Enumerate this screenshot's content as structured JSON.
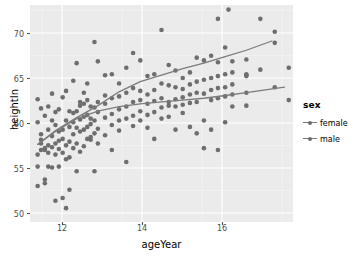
{
  "chart_data": {
    "type": "scatter",
    "title": "",
    "xlabel": "ageYear",
    "ylabel": "heightIn",
    "xlim": [
      11.4,
      17.6
    ],
    "ylim": [
      49.0,
      72.5
    ],
    "xticks": [
      12,
      14,
      16
    ],
    "yticks": [
      50,
      55,
      60,
      65,
      70
    ],
    "grid": true,
    "legend": {
      "title": "sex",
      "position": "right",
      "entries": [
        "female",
        "male"
      ]
    },
    "colors": {
      "point": "#6e6e6e",
      "line": "#7b7b7b",
      "panel_background": "#ebebeb",
      "grid_major": "#ffffff",
      "grid_minor": "#f5f5f5",
      "axis_text": "#4d4d4d",
      "axis_title": "#000000"
    },
    "series": [
      {
        "name": "female",
        "points": [
          [
            11.58,
            56.3
          ],
          [
            11.58,
            62.3
          ],
          [
            11.58,
            59.8
          ],
          [
            11.58,
            55.0
          ],
          [
            11.58,
            52.9
          ],
          [
            11.66,
            61.3
          ],
          [
            11.66,
            57.5
          ],
          [
            11.66,
            57.9
          ],
          [
            11.66,
            56.8
          ],
          [
            11.66,
            58.5
          ],
          [
            11.75,
            60.5
          ],
          [
            11.75,
            56.8
          ],
          [
            11.75,
            57.0
          ],
          [
            11.75,
            53.6
          ],
          [
            11.75,
            53.2
          ],
          [
            11.83,
            61.5
          ],
          [
            11.83,
            57.3
          ],
          [
            11.83,
            56.5
          ],
          [
            11.83,
            59.0
          ],
          [
            11.83,
            55.0
          ],
          [
            11.92,
            60.0
          ],
          [
            11.92,
            58.3
          ],
          [
            11.92,
            57.1
          ],
          [
            11.92,
            54.9
          ],
          [
            11.92,
            62.9
          ],
          [
            12.0,
            59.5
          ],
          [
            12.0,
            57.5
          ],
          [
            12.0,
            56.3
          ],
          [
            12.0,
            60.9
          ],
          [
            12.0,
            51.3
          ],
          [
            12.08,
            58.8
          ],
          [
            12.08,
            56.9
          ],
          [
            12.08,
            61.2
          ],
          [
            12.08,
            55.0
          ],
          [
            12.08,
            57.8
          ],
          [
            12.17,
            62.5
          ],
          [
            12.17,
            59.0
          ],
          [
            12.17,
            58.0
          ],
          [
            12.17,
            56.5
          ],
          [
            12.17,
            51.6
          ],
          [
            12.25,
            63.2
          ],
          [
            12.25,
            60.0
          ],
          [
            12.25,
            57.3
          ],
          [
            12.25,
            55.8
          ],
          [
            12.25,
            50.5
          ],
          [
            12.33,
            61.0
          ],
          [
            12.33,
            59.3
          ],
          [
            12.33,
            57.7
          ],
          [
            12.33,
            56.0
          ],
          [
            12.33,
            52.5
          ],
          [
            12.42,
            64.3
          ],
          [
            12.42,
            60.8
          ],
          [
            12.42,
            58.5
          ],
          [
            12.42,
            57.0
          ],
          [
            12.42,
            59.8
          ],
          [
            12.5,
            66.2
          ],
          [
            12.5,
            61.0
          ],
          [
            12.5,
            59.2
          ],
          [
            12.5,
            57.5
          ],
          [
            12.5,
            54.5
          ],
          [
            12.58,
            62.0
          ],
          [
            12.58,
            60.1
          ],
          [
            12.58,
            58.8
          ],
          [
            12.58,
            56.6
          ],
          [
            12.58,
            61.6
          ],
          [
            12.67,
            63.0
          ],
          [
            12.67,
            60.4
          ],
          [
            12.67,
            59.0
          ],
          [
            12.67,
            57.2
          ],
          [
            12.67,
            61.8
          ],
          [
            12.75,
            62.2
          ],
          [
            12.75,
            60.6
          ],
          [
            12.75,
            59.3
          ],
          [
            12.75,
            58.0
          ],
          [
            12.75,
            64.0
          ],
          [
            12.83,
            61.5
          ],
          [
            12.83,
            60.2
          ],
          [
            12.83,
            59.6
          ],
          [
            12.83,
            57.9
          ],
          [
            12.83,
            58.2
          ],
          [
            12.92,
            68.5
          ],
          [
            12.92,
            61.4
          ],
          [
            12.92,
            60.0
          ],
          [
            12.92,
            58.6
          ],
          [
            12.92,
            54.5
          ],
          [
            13.0,
            66.4
          ],
          [
            13.0,
            62.0
          ],
          [
            13.0,
            60.9
          ],
          [
            13.0,
            59.1
          ],
          [
            13.0,
            57.5
          ],
          [
            13.17,
            64.9
          ],
          [
            13.17,
            61.8
          ],
          [
            13.17,
            60.3
          ],
          [
            13.17,
            58.4
          ],
          [
            13.17,
            62.7
          ],
          [
            13.33,
            65.0
          ],
          [
            13.33,
            62.4
          ],
          [
            13.33,
            60.7
          ],
          [
            13.33,
            59.5
          ],
          [
            13.33,
            56.8
          ],
          [
            13.5,
            64.0
          ],
          [
            13.5,
            62.6
          ],
          [
            13.5,
            61.2
          ],
          [
            13.5,
            60.0
          ],
          [
            13.5,
            58.9
          ],
          [
            13.67,
            65.7
          ],
          [
            13.67,
            63.0
          ],
          [
            13.67,
            61.5
          ],
          [
            13.67,
            60.2
          ],
          [
            13.67,
            55.5
          ],
          [
            13.83,
            67.3
          ],
          [
            13.83,
            63.5
          ],
          [
            13.83,
            62.0
          ],
          [
            13.83,
            60.5
          ],
          [
            13.83,
            59.4
          ],
          [
            14.0,
            66.5
          ],
          [
            14.0,
            63.2
          ],
          [
            14.0,
            62.2
          ],
          [
            14.0,
            61.0
          ],
          [
            14.0,
            60.0
          ],
          [
            14.17,
            64.8
          ],
          [
            14.17,
            62.8
          ],
          [
            14.17,
            61.8
          ],
          [
            14.17,
            60.6
          ],
          [
            14.17,
            59.2
          ],
          [
            14.33,
            65.0
          ],
          [
            14.33,
            63.3
          ],
          [
            14.33,
            62.1
          ],
          [
            14.33,
            60.9
          ],
          [
            14.33,
            58.0
          ],
          [
            14.5,
            69.8
          ],
          [
            14.5,
            64.0
          ],
          [
            14.5,
            62.4
          ],
          [
            14.5,
            61.4
          ],
          [
            14.5,
            60.2
          ],
          [
            14.67,
            66.0
          ],
          [
            14.67,
            63.8
          ],
          [
            14.67,
            62.0
          ],
          [
            14.67,
            61.6
          ],
          [
            14.67,
            60.4
          ],
          [
            14.83,
            65.4
          ],
          [
            14.83,
            63.6
          ],
          [
            14.83,
            62.3
          ],
          [
            14.83,
            61.5
          ],
          [
            14.83,
            59.0
          ],
          [
            15.0,
            64.6
          ],
          [
            15.0,
            63.4
          ],
          [
            15.0,
            62.5
          ],
          [
            15.0,
            61.7
          ],
          [
            15.0,
            60.8
          ],
          [
            15.17,
            65.2
          ],
          [
            15.17,
            63.9
          ],
          [
            15.17,
            62.8
          ],
          [
            15.17,
            61.9
          ],
          [
            15.17,
            59.3
          ],
          [
            15.33,
            66.8
          ],
          [
            15.33,
            64.2
          ],
          [
            15.33,
            63.0
          ],
          [
            15.33,
            62.0
          ],
          [
            15.33,
            58.6
          ],
          [
            15.5,
            66.5
          ],
          [
            15.5,
            64.4
          ],
          [
            15.5,
            62.9
          ],
          [
            15.5,
            60.0
          ],
          [
            15.5,
            57.0
          ],
          [
            15.67,
            67.0
          ],
          [
            15.67,
            64.6
          ],
          [
            15.67,
            63.3
          ],
          [
            15.67,
            62.2
          ],
          [
            15.67,
            59.0
          ],
          [
            15.83,
            66.3
          ],
          [
            15.83,
            64.8
          ],
          [
            15.83,
            63.5
          ],
          [
            15.83,
            62.4
          ],
          [
            15.83,
            56.8
          ],
          [
            16.0,
            67.9
          ],
          [
            16.0,
            65.0
          ],
          [
            16.0,
            63.6
          ],
          [
            16.0,
            62.6
          ],
          [
            16.0,
            59.8
          ],
          [
            16.17,
            66.4
          ],
          [
            16.17,
            65.2
          ],
          [
            16.17,
            63.9
          ],
          [
            16.17,
            62.8
          ],
          [
            16.17,
            61.5
          ],
          [
            16.5,
            66.6
          ],
          [
            16.5,
            65.0
          ],
          [
            16.5,
            64.8
          ],
          [
            16.5,
            63.0
          ],
          [
            16.5,
            61.6
          ],
          [
            16.83,
            71.0
          ],
          [
            16.83,
            65.5
          ],
          [
            17.17,
            69.6
          ],
          [
            17.17,
            68.4
          ],
          [
            17.17,
            63.6
          ],
          [
            17.5,
            65.7
          ],
          [
            17.5,
            62.2
          ],
          [
            16.08,
            72.0
          ],
          [
            15.83,
            71.0
          ],
          [
            16.5,
            64.9
          ]
        ]
      }
    ],
    "fit_lines": [
      {
        "name": "male",
        "description": "steeper upper loess curve",
        "points": [
          [
            11.58,
            57.4
          ],
          [
            12.0,
            58.9
          ],
          [
            12.5,
            60.3
          ],
          [
            13.0,
            61.6
          ],
          [
            13.5,
            63.1
          ],
          [
            14.0,
            64.2
          ],
          [
            14.5,
            64.9
          ],
          [
            15.0,
            65.6
          ],
          [
            15.5,
            66.2
          ],
          [
            16.0,
            66.9
          ],
          [
            16.5,
            67.6
          ],
          [
            17.1,
            68.6
          ]
        ]
      },
      {
        "name": "female",
        "description": "flatter lower loess curve",
        "points": [
          [
            11.58,
            57.4
          ],
          [
            12.0,
            58.8
          ],
          [
            12.5,
            60.2
          ],
          [
            13.0,
            61.0
          ],
          [
            13.5,
            61.5
          ],
          [
            14.0,
            61.8
          ],
          [
            14.5,
            62.0
          ],
          [
            15.0,
            62.2
          ],
          [
            15.5,
            62.4
          ],
          [
            16.0,
            62.7
          ],
          [
            16.5,
            63.0
          ],
          [
            17.4,
            63.6
          ]
        ]
      }
    ]
  },
  "axes": {
    "x_title": "ageYear",
    "y_title": "heightIn",
    "x_tick_labels": [
      "12",
      "14",
      "16"
    ],
    "y_tick_labels": [
      "70",
      "65",
      "60",
      "55",
      "50"
    ]
  },
  "legend": {
    "title": "sex",
    "items": [
      {
        "label": "female"
      },
      {
        "label": "male"
      }
    ]
  }
}
